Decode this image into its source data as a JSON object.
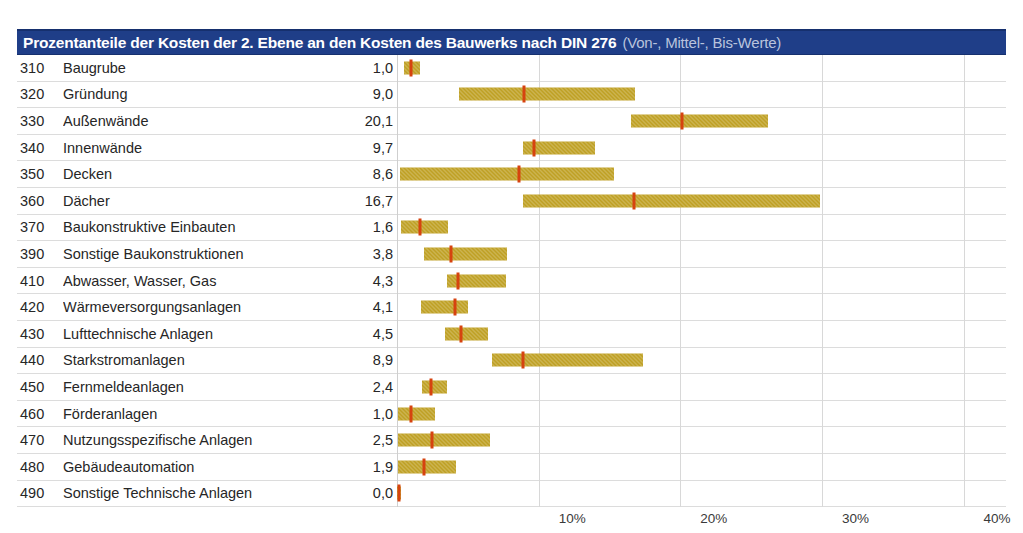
{
  "title": {
    "main": "Prozentanteile der Kosten der 2. Ebene an den Kosten des Bauwerks nach DIN 276",
    "sub": "(Von-, Mittel-, Bis-Werte)"
  },
  "colors": {
    "title_bar": "#1F3E88",
    "bar": "#BFA024",
    "marker": "#D6430F",
    "gridline": "#d8d8d8"
  },
  "chart_data": {
    "type": "bar",
    "title": "Prozentanteile der Kosten der 2. Ebene an den Kosten des Bauwerks nach DIN 276 (Von-, Mittel-, Bis-Werte)",
    "xlabel": "",
    "ylabel": "",
    "xlim": [
      0,
      43
    ],
    "grid": true,
    "legend": "none",
    "xticks": [
      10,
      20,
      30,
      40
    ],
    "xtick_labels": [
      "10%",
      "20%",
      "30%",
      "40%"
    ],
    "value_unit": "%",
    "columns": [
      "Kostengruppe",
      "Bezeichnung",
      "Mittelwert",
      "Von",
      "Bis"
    ],
    "rows": [
      {
        "code": "310",
        "label": "Baugrube",
        "value": "1,0",
        "mid": 1.0,
        "from": 0.5,
        "to": 1.6
      },
      {
        "code": "320",
        "label": "Gründung",
        "value": "9,0",
        "mid": 9.0,
        "from": 4.4,
        "to": 16.8
      },
      {
        "code": "330",
        "label": "Außenwände",
        "value": "20,1",
        "mid": 20.1,
        "from": 16.5,
        "to": 26.2
      },
      {
        "code": "340",
        "label": "Innenwände",
        "value": "9,7",
        "mid": 9.7,
        "from": 8.9,
        "to": 14.0
      },
      {
        "code": "350",
        "label": "Decken",
        "value": "8,6",
        "mid": 8.6,
        "from": 0.2,
        "to": 15.3
      },
      {
        "code": "360",
        "label": "Dächer",
        "value": "16,7",
        "mid": 16.7,
        "from": 8.9,
        "to": 29.9
      },
      {
        "code": "370",
        "label": "Baukonstruktive Einbauten",
        "value": "1,6",
        "mid": 1.6,
        "from": 0.3,
        "to": 3.6
      },
      {
        "code": "390",
        "label": "Sonstige Baukonstruktionen",
        "value": "3,8",
        "mid": 3.8,
        "from": 1.9,
        "to": 7.8
      },
      {
        "code": "410",
        "label": "Abwasser, Wasser, Gas",
        "value": "4,3",
        "mid": 4.3,
        "from": 3.5,
        "to": 7.7
      },
      {
        "code": "420",
        "label": "Wärmeversorgungsanlagen",
        "value": "4,1",
        "mid": 4.1,
        "from": 1.7,
        "to": 5.0
      },
      {
        "code": "430",
        "label": "Lufttechnische Anlagen",
        "value": "4,5",
        "mid": 4.5,
        "from": 3.4,
        "to": 6.4
      },
      {
        "code": "440",
        "label": "Starkstromanlagen",
        "value": "8,9",
        "mid": 8.9,
        "from": 6.7,
        "to": 17.4
      },
      {
        "code": "450",
        "label": "Fernmeldeanlagen",
        "value": "2,4",
        "mid": 2.4,
        "from": 1.8,
        "to": 3.5
      },
      {
        "code": "460",
        "label": "Förderanlagen",
        "value": "1,0",
        "mid": 1.0,
        "from": 0.1,
        "to": 2.7
      },
      {
        "code": "470",
        "label": "Nutzungsspezifische Anlagen",
        "value": "2,5",
        "mid": 2.5,
        "from": 0.1,
        "to": 6.6
      },
      {
        "code": "480",
        "label": "Gebäudeautomation",
        "value": "1,9",
        "mid": 1.9,
        "from": 0.1,
        "to": 4.2
      },
      {
        "code": "490",
        "label": "Sonstige Technische Anlagen",
        "value": "0,0",
        "mid": 0.15,
        "from": 0.0,
        "to": 0.3
      }
    ]
  }
}
